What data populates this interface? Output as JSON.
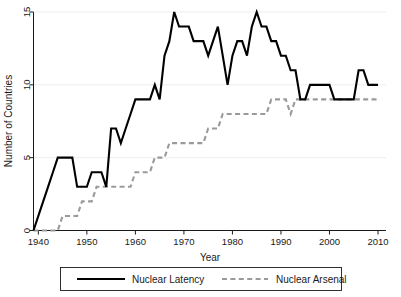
{
  "chart_data": {
    "type": "line",
    "title": "",
    "xlabel": "Year",
    "ylabel": "Number of Countries",
    "xlim": [
      1939,
      2010
    ],
    "ylim": [
      0,
      15
    ],
    "xticks": [
      1940,
      1950,
      1960,
      1970,
      1980,
      1990,
      2000,
      2010
    ],
    "xtick_labels": [
      "1940",
      "1950",
      "1960",
      "1970",
      "1980",
      "1990",
      "2000",
      "2010"
    ],
    "yticks": [
      0,
      5,
      10,
      15
    ],
    "ytick_labels": [
      "0",
      "5",
      "10",
      "15"
    ],
    "grid": "horizontal",
    "legend_position": "below-axis",
    "x": [
      1939,
      1940,
      1941,
      1942,
      1943,
      1944,
      1945,
      1946,
      1947,
      1948,
      1949,
      1950,
      1951,
      1952,
      1953,
      1954,
      1955,
      1956,
      1957,
      1958,
      1959,
      1960,
      1961,
      1962,
      1963,
      1964,
      1965,
      1966,
      1967,
      1968,
      1969,
      1970,
      1971,
      1972,
      1973,
      1974,
      1975,
      1976,
      1977,
      1978,
      1979,
      1980,
      1981,
      1982,
      1983,
      1984,
      1985,
      1986,
      1987,
      1988,
      1989,
      1990,
      1991,
      1992,
      1993,
      1994,
      1995,
      1996,
      1997,
      1998,
      1999,
      2000,
      2001,
      2002,
      2003,
      2004,
      2005,
      2006,
      2007,
      2008,
      2009,
      2010
    ],
    "series": [
      {
        "name": "Nuclear Latency",
        "style": "solid",
        "color": "#000000",
        "values": [
          0,
          1,
          2,
          3,
          4,
          5,
          5,
          5,
          5,
          3,
          3,
          3,
          4,
          4,
          4,
          3,
          7,
          7,
          6,
          7,
          8,
          9,
          9,
          9,
          9,
          10,
          9,
          12,
          13,
          15,
          14,
          14,
          14,
          13,
          13,
          13,
          12,
          13,
          14,
          12,
          10,
          12,
          13,
          13,
          12,
          14,
          15,
          14,
          14,
          13,
          13,
          12,
          12,
          11,
          11,
          9,
          9,
          10,
          10,
          10,
          10,
          10,
          9,
          9,
          9,
          9,
          9,
          11,
          11,
          10,
          10,
          10
        ]
      },
      {
        "name": "Nuclear Arsenal",
        "style": "dashed",
        "color": "#9a9a9a",
        "values": [
          0,
          0,
          0,
          0,
          0,
          0,
          1,
          1,
          1,
          1,
          2,
          2,
          2,
          3,
          3,
          3,
          3,
          3,
          3,
          3,
          3,
          4,
          4,
          4,
          4,
          5,
          5,
          5,
          6,
          6,
          6,
          6,
          6,
          6,
          6,
          6,
          7,
          7,
          7,
          8,
          8,
          8,
          8,
          8,
          8,
          8,
          8,
          8,
          8,
          9,
          9,
          9,
          9,
          8,
          9,
          9,
          9,
          9,
          9,
          9,
          9,
          9,
          9,
          9,
          9,
          9,
          9,
          9,
          9,
          9,
          9,
          9
        ]
      }
    ]
  },
  "legend": {
    "entries": [
      {
        "label": "Nuclear Latency"
      },
      {
        "label": "Nuclear Arsenal"
      }
    ]
  }
}
